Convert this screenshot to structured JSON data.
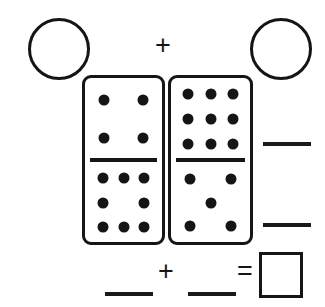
{
  "worksheet": {
    "type": "domino-addition-worksheet",
    "background_color": "#ffffff",
    "ink_color": "#151515",
    "top_operator": "+",
    "bottom_operator": "+",
    "equals_operator": "="
  },
  "answer_circles": [
    {
      "name": "left-domino-total-circle",
      "value": ""
    },
    {
      "name": "right-domino-total-circle",
      "value": ""
    }
  ],
  "dominoes": [
    {
      "name": "left-domino",
      "top_pips": 4,
      "bottom_pips": 8,
      "top_pattern": "four",
      "bottom_pattern": "eight"
    },
    {
      "name": "right-domino",
      "top_pips": 9,
      "bottom_pips": 5,
      "top_pattern": "nine",
      "bottom_pattern": "five"
    }
  ],
  "blanks": {
    "right_upper": "",
    "right_lower": "",
    "bottom_left": "",
    "bottom_right": ""
  },
  "answer_box": {
    "name": "final-answer-box",
    "value": ""
  }
}
